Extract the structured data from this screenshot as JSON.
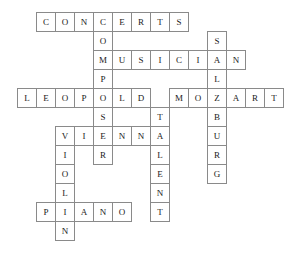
{
  "puzzle": {
    "title": "Mozart Crossword",
    "type": "crossword-grid",
    "cell_size": 19,
    "origin_x": 17,
    "origin_y": 12,
    "columns": 15,
    "rows": 13,
    "colors": {
      "background": "#ffffff",
      "cell_fill": "#ffffff",
      "cell_border": "#8a8a8a",
      "letter": "#1a1a1a"
    },
    "entries": [
      {
        "answer": "CONCERTS",
        "direction": "across",
        "row": 0,
        "col": 1,
        "length": 8
      },
      {
        "answer": "MUSICIAN",
        "direction": "across",
        "row": 2,
        "col": 4,
        "length": 8
      },
      {
        "answer": "LEOPOLD",
        "direction": "across",
        "row": 4,
        "col": 0,
        "length": 7
      },
      {
        "answer": "MOZART",
        "direction": "across",
        "row": 4,
        "col": 8,
        "length": 6
      },
      {
        "answer": "VIENNA",
        "direction": "across",
        "row": 6,
        "col": 2,
        "length": 6
      },
      {
        "answer": "PIANO",
        "direction": "across",
        "row": 10,
        "col": 1,
        "length": 5
      },
      {
        "answer": "COMPOSER",
        "direction": "down",
        "row": 0,
        "col": 4,
        "length": 8
      },
      {
        "answer": "SALZBURG",
        "direction": "down",
        "row": 1,
        "col": 10,
        "length": 8
      },
      {
        "answer": "TALENT",
        "direction": "down",
        "row": 5,
        "col": 7,
        "length": 6
      },
      {
        "answer": "VIOLIN",
        "direction": "down",
        "row": 6,
        "col": 2,
        "length": 6
      }
    ],
    "cells": [
      {
        "row": 0,
        "col": 1,
        "letter": "C"
      },
      {
        "row": 0,
        "col": 2,
        "letter": "O"
      },
      {
        "row": 0,
        "col": 3,
        "letter": "N"
      },
      {
        "row": 0,
        "col": 4,
        "letter": "C"
      },
      {
        "row": 0,
        "col": 5,
        "letter": "E"
      },
      {
        "row": 0,
        "col": 6,
        "letter": "R"
      },
      {
        "row": 0,
        "col": 7,
        "letter": "T"
      },
      {
        "row": 0,
        "col": 8,
        "letter": "S"
      },
      {
        "row": 1,
        "col": 4,
        "letter": "O"
      },
      {
        "row": 1,
        "col": 10,
        "letter": "S"
      },
      {
        "row": 2,
        "col": 4,
        "letter": "M"
      },
      {
        "row": 2,
        "col": 5,
        "letter": "U"
      },
      {
        "row": 2,
        "col": 6,
        "letter": "S"
      },
      {
        "row": 2,
        "col": 7,
        "letter": "I"
      },
      {
        "row": 2,
        "col": 8,
        "letter": "C"
      },
      {
        "row": 2,
        "col": 9,
        "letter": "I"
      },
      {
        "row": 2,
        "col": 10,
        "letter": "A"
      },
      {
        "row": 2,
        "col": 11,
        "letter": "N"
      },
      {
        "row": 3,
        "col": 4,
        "letter": "P"
      },
      {
        "row": 3,
        "col": 10,
        "letter": "L"
      },
      {
        "row": 4,
        "col": 0,
        "letter": "L"
      },
      {
        "row": 4,
        "col": 1,
        "letter": "E"
      },
      {
        "row": 4,
        "col": 2,
        "letter": "O"
      },
      {
        "row": 4,
        "col": 3,
        "letter": "P"
      },
      {
        "row": 4,
        "col": 4,
        "letter": "O"
      },
      {
        "row": 4,
        "col": 5,
        "letter": "L"
      },
      {
        "row": 4,
        "col": 6,
        "letter": "D"
      },
      {
        "row": 4,
        "col": 8,
        "letter": "M"
      },
      {
        "row": 4,
        "col": 9,
        "letter": "O"
      },
      {
        "row": 4,
        "col": 10,
        "letter": "Z"
      },
      {
        "row": 4,
        "col": 11,
        "letter": "A"
      },
      {
        "row": 4,
        "col": 12,
        "letter": "R"
      },
      {
        "row": 4,
        "col": 13,
        "letter": "T"
      },
      {
        "row": 5,
        "col": 4,
        "letter": "S"
      },
      {
        "row": 5,
        "col": 7,
        "letter": "T"
      },
      {
        "row": 5,
        "col": 10,
        "letter": "B"
      },
      {
        "row": 6,
        "col": 2,
        "letter": "V"
      },
      {
        "row": 6,
        "col": 3,
        "letter": "I"
      },
      {
        "row": 6,
        "col": 4,
        "letter": "E"
      },
      {
        "row": 6,
        "col": 5,
        "letter": "N"
      },
      {
        "row": 6,
        "col": 6,
        "letter": "N"
      },
      {
        "row": 6,
        "col": 7,
        "letter": "A"
      },
      {
        "row": 6,
        "col": 10,
        "letter": "U"
      },
      {
        "row": 7,
        "col": 2,
        "letter": "I"
      },
      {
        "row": 7,
        "col": 4,
        "letter": "R"
      },
      {
        "row": 7,
        "col": 7,
        "letter": "L"
      },
      {
        "row": 7,
        "col": 10,
        "letter": "R"
      },
      {
        "row": 8,
        "col": 2,
        "letter": "O"
      },
      {
        "row": 8,
        "col": 7,
        "letter": "E"
      },
      {
        "row": 8,
        "col": 10,
        "letter": "G"
      },
      {
        "row": 9,
        "col": 2,
        "letter": "L"
      },
      {
        "row": 9,
        "col": 7,
        "letter": "N"
      },
      {
        "row": 10,
        "col": 1,
        "letter": "P"
      },
      {
        "row": 10,
        "col": 2,
        "letter": "I"
      },
      {
        "row": 10,
        "col": 3,
        "letter": "A"
      },
      {
        "row": 10,
        "col": 4,
        "letter": "N"
      },
      {
        "row": 10,
        "col": 5,
        "letter": "O"
      },
      {
        "row": 10,
        "col": 7,
        "letter": "T"
      },
      {
        "row": 11,
        "col": 2,
        "letter": "N"
      }
    ]
  }
}
